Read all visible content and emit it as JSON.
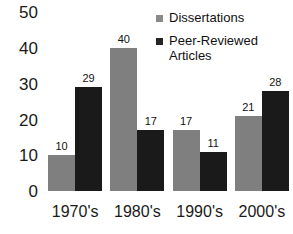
{
  "chart_data": {
    "type": "bar",
    "title": "",
    "xlabel": "",
    "ylabel": "",
    "ylim": [
      0,
      50
    ],
    "yticks": [
      0,
      10,
      20,
      30,
      40,
      50
    ],
    "grid": false,
    "legend_position": "top-right",
    "categories": [
      "1970's",
      "1980's",
      "1990's",
      "2000's"
    ],
    "series": [
      {
        "name": "Dissertations",
        "color": "#7f7f7f",
        "values": [
          10,
          40,
          17,
          21
        ]
      },
      {
        "name": "Peer-Reviewed Articles",
        "color": "#1a1a1a",
        "values": [
          29,
          17,
          11,
          28
        ]
      }
    ],
    "legend": [
      {
        "label_lines": [
          "Dissertations"
        ],
        "swatch": "#8a8a8a"
      },
      {
        "label_lines": [
          "Peer-Reviewed",
          "Articles"
        ],
        "swatch": "#262626"
      }
    ],
    "data_labels": [
      [
        "10",
        "29"
      ],
      [
        "40",
        "17"
      ],
      [
        "17",
        "11"
      ],
      [
        "21",
        "28"
      ]
    ]
  }
}
